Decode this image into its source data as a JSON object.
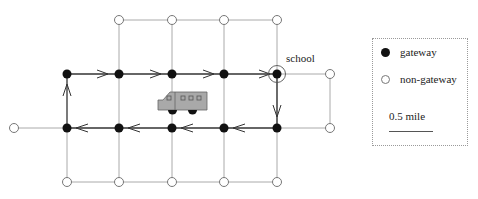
{
  "labels": {
    "school": "school"
  },
  "legend": {
    "gateway_label": "gateway",
    "non_gateway_label": "non-gateway",
    "scale_label": "0.5 mile"
  },
  "colors": {
    "grid_line": "#aaaaaa",
    "route_line": "#333333",
    "gateway_fill": "#111111",
    "non_gateway_stroke": "#777777",
    "bus_fill": "#a9a9a9"
  },
  "diagram": {
    "nodes": [
      {
        "id": "t1",
        "x": 119,
        "y": 20,
        "type": "non-gateway"
      },
      {
        "id": "t2",
        "x": 172,
        "y": 20,
        "type": "non-gateway"
      },
      {
        "id": "t3",
        "x": 224,
        "y": 20,
        "type": "non-gateway"
      },
      {
        "id": "t4",
        "x": 277,
        "y": 20,
        "type": "non-gateway"
      },
      {
        "id": "u0",
        "x": 67,
        "y": 74,
        "type": "gateway"
      },
      {
        "id": "u1",
        "x": 119,
        "y": 74,
        "type": "gateway"
      },
      {
        "id": "u2",
        "x": 172,
        "y": 74,
        "type": "gateway"
      },
      {
        "id": "u3",
        "x": 224,
        "y": 74,
        "type": "gateway"
      },
      {
        "id": "u4",
        "x": 277,
        "y": 74,
        "type": "gateway",
        "school": true
      },
      {
        "id": "u5",
        "x": 330,
        "y": 74,
        "type": "non-gateway"
      },
      {
        "id": "m_left",
        "x": 14,
        "y": 128,
        "type": "non-gateway"
      },
      {
        "id": "m0",
        "x": 67,
        "y": 128,
        "type": "gateway"
      },
      {
        "id": "m1",
        "x": 119,
        "y": 128,
        "type": "gateway"
      },
      {
        "id": "m2",
        "x": 172,
        "y": 128,
        "type": "gateway"
      },
      {
        "id": "m3",
        "x": 224,
        "y": 128,
        "type": "gateway"
      },
      {
        "id": "m4",
        "x": 277,
        "y": 128,
        "type": "gateway"
      },
      {
        "id": "m5",
        "x": 330,
        "y": 128,
        "type": "non-gateway"
      },
      {
        "id": "b0",
        "x": 67,
        "y": 182,
        "type": "non-gateway"
      },
      {
        "id": "b1",
        "x": 119,
        "y": 182,
        "type": "non-gateway"
      },
      {
        "id": "b2",
        "x": 172,
        "y": 182,
        "type": "non-gateway"
      },
      {
        "id": "b3",
        "x": 224,
        "y": 182,
        "type": "non-gateway"
      },
      {
        "id": "b4",
        "x": 277,
        "y": 182,
        "type": "non-gateway"
      }
    ],
    "route": [
      "m0",
      "u0",
      "u1",
      "u2",
      "u3",
      "u4",
      "m4",
      "m3",
      "m2",
      "m1",
      "m0"
    ]
  }
}
